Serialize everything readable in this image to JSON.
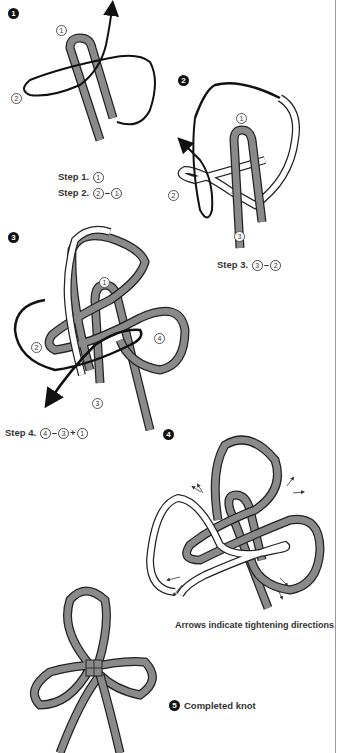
{
  "steps": [
    {
      "badge": "1",
      "caption_lines": [
        {
          "prefix": "Step 1.",
          "parts": [
            "1"
          ]
        },
        {
          "prefix": "Step 2.",
          "parts": [
            "2",
            "–",
            "1"
          ]
        }
      ],
      "labels": [
        "1",
        "2"
      ]
    },
    {
      "badge": "2",
      "caption": {
        "prefix": "Step 3.",
        "parts": [
          "3",
          "–",
          "2"
        ]
      },
      "labels": [
        "1",
        "2",
        "3"
      ]
    },
    {
      "badge": "3",
      "caption": {
        "prefix": "Step 4.",
        "parts": [
          "4",
          "–",
          "3",
          "+",
          "1"
        ]
      },
      "labels": [
        "1",
        "2",
        "3",
        "4"
      ]
    },
    {
      "badge": "4",
      "caption": "Arrows indicate tightening directions"
    },
    {
      "badge": "5",
      "caption": "Completed knot"
    }
  ],
  "colors": {
    "cord": "#8a8a8a",
    "cord_outline": "#222222",
    "working_end": "#111111",
    "white_cord": "#ffffff"
  }
}
